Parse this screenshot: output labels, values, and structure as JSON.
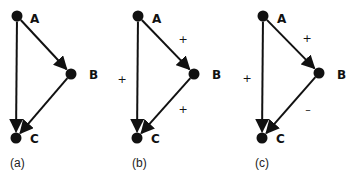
{
  "diagram": {
    "colors": {
      "ink": "#111111",
      "background": "#ffffff"
    },
    "panels": [
      {
        "id": "a",
        "caption": "(a)",
        "caption_pos": [
          10,
          167
        ],
        "nodes": [
          {
            "id": "A",
            "label": "A",
            "x": 17,
            "y": 16,
            "lx": 30,
            "ly": 23
          },
          {
            "id": "B",
            "label": "B",
            "x": 71,
            "y": 74,
            "lx": 89,
            "ly": 79
          },
          {
            "id": "C",
            "label": "C",
            "x": 16,
            "y": 138,
            "lx": 30,
            "ly": 143
          }
        ],
        "edges": [
          {
            "from": "A",
            "to": "B",
            "sign": ""
          },
          {
            "from": "B",
            "to": "C",
            "sign": ""
          },
          {
            "from": "A",
            "to": "C",
            "sign": ""
          }
        ]
      },
      {
        "id": "b",
        "caption": "(b)",
        "caption_pos": [
          132,
          167
        ],
        "nodes": [
          {
            "id": "A",
            "label": "A",
            "x": 138,
            "y": 16,
            "lx": 152,
            "ly": 23
          },
          {
            "id": "B",
            "label": "B",
            "x": 194,
            "y": 74,
            "lx": 212,
            "ly": 79
          },
          {
            "id": "C",
            "label": "C",
            "x": 137,
            "y": 138,
            "lx": 151,
            "ly": 143
          }
        ],
        "edges": [
          {
            "from": "A",
            "to": "B",
            "sign": "+",
            "sx": 183,
            "sy": 43
          },
          {
            "from": "B",
            "to": "C",
            "sign": "+",
            "sx": 183,
            "sy": 113
          },
          {
            "from": "A",
            "to": "C",
            "sign": "+",
            "sx": 122,
            "sy": 83
          }
        ]
      },
      {
        "id": "c",
        "caption": "(c)",
        "caption_pos": [
          255,
          167
        ],
        "nodes": [
          {
            "id": "A",
            "label": "A",
            "x": 263,
            "y": 16,
            "lx": 277,
            "ly": 23
          },
          {
            "id": "B",
            "label": "B",
            "x": 319,
            "y": 73,
            "lx": 337,
            "ly": 79
          },
          {
            "id": "C",
            "label": "C",
            "x": 262,
            "y": 138,
            "lx": 276,
            "ly": 143
          }
        ],
        "edges": [
          {
            "from": "A",
            "to": "B",
            "sign": "+",
            "sx": 307,
            "sy": 42
          },
          {
            "from": "B",
            "to": "C",
            "sign": "–",
            "sx": 308,
            "sy": 113
          },
          {
            "from": "A",
            "to": "C",
            "sign": "+",
            "sx": 247,
            "sy": 82
          }
        ]
      }
    ]
  }
}
